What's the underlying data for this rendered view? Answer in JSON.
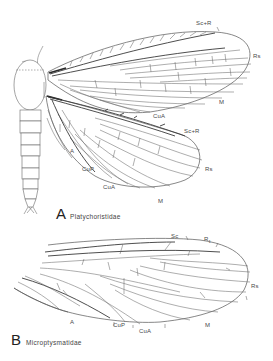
{
  "figure": {
    "panels": [
      {
        "letter": "A",
        "family": "Platychoristidae",
        "forewing_labels": {
          "sc_r": "Sc+R",
          "rs": "Rs",
          "m": "M",
          "cua": "CuA"
        },
        "hindwing_labels": {
          "sc_r": "Sc+R",
          "rs": "Rs",
          "m": "M",
          "cua": "CuA",
          "cup": "CuP",
          "a": "A"
        }
      },
      {
        "letter": "B",
        "family": "Microptysmatidae",
        "wing_labels": {
          "sc": "Sc",
          "r1_main": "R",
          "r1_sub": "1",
          "rs": "Rs",
          "m": "M",
          "cua": "CuA",
          "cup": "CuP",
          "a": "A"
        }
      }
    ]
  }
}
